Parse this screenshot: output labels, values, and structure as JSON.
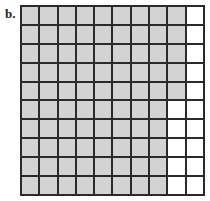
{
  "figure": {
    "label": "b.",
    "rows": 10,
    "cols": 10,
    "shaded_per_row": [
      9,
      9,
      9,
      9,
      9,
      8,
      8,
      8,
      8,
      8
    ],
    "total_shaded": 85,
    "total_cells": 100,
    "colors": {
      "shaded": "#d3d3d3",
      "unshaded": "#ffffff",
      "line": "#2a2a2a"
    }
  }
}
